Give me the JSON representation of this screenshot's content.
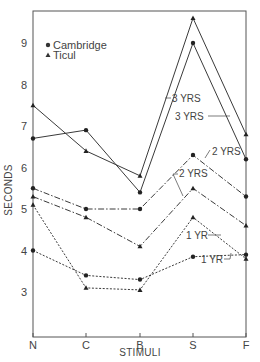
{
  "chart_data": {
    "type": "line",
    "title": "",
    "xlabel": "STIMULI",
    "ylabel": "SECONDS",
    "categories": [
      "N",
      "C",
      "B",
      "S",
      "F"
    ],
    "ylim": [
      2.1,
      9.8
    ],
    "yticks": [
      3,
      4,
      5,
      6,
      7,
      8,
      9
    ],
    "grid": false,
    "legend": {
      "position": "upper-left",
      "entries": [
        {
          "label": "Cambridge",
          "marker": "circle"
        },
        {
          "label": "Ticul",
          "marker": "triangle"
        }
      ]
    },
    "series": [
      {
        "name": "Cambridge 3 YRS",
        "group": "Cambridge",
        "age": "3 YRS",
        "marker": "circle",
        "linestyle": "solid",
        "values": [
          6.7,
          6.9,
          5.4,
          9.0,
          6.2
        ]
      },
      {
        "name": "Ticul 3 YRS",
        "group": "Ticul",
        "age": "3 YRS",
        "marker": "triangle",
        "linestyle": "solid",
        "values": [
          7.5,
          6.4,
          5.8,
          9.6,
          6.8
        ]
      },
      {
        "name": "Cambridge 2 YRS",
        "group": "Cambridge",
        "age": "2 YRS",
        "marker": "circle",
        "linestyle": "dashdot",
        "values": [
          5.5,
          5.0,
          5.0,
          6.3,
          5.3
        ]
      },
      {
        "name": "Ticul 2 YRS",
        "group": "Ticul",
        "age": "2 YRS",
        "marker": "triangle",
        "linestyle": "dashdot",
        "values": [
          5.3,
          4.8,
          4.1,
          5.5,
          4.6
        ]
      },
      {
        "name": "Cambridge 1 YR",
        "group": "Cambridge",
        "age": "1 YR",
        "marker": "circle",
        "linestyle": "dotted",
        "values": [
          4.0,
          3.4,
          3.3,
          3.85,
          3.9
        ]
      },
      {
        "name": "Ticul 1 YR",
        "group": "Ticul",
        "age": "1 YR",
        "marker": "triangle",
        "linestyle": "dotted",
        "values": [
          5.1,
          3.1,
          3.05,
          4.8,
          3.8
        ]
      }
    ],
    "annotations": [
      "3 YRS",
      "3 YRS",
      "2 YRS",
      "2 YRS",
      "1 YR",
      "1 YR"
    ]
  },
  "labels": {
    "xlabel": "STIMULI",
    "ylabel": "SECONDS",
    "legend_cambridge": "Cambridge",
    "legend_ticul": "Ticul",
    "ann_3yrs_a": "3 YRS",
    "ann_3yrs_b": "3 YRS",
    "ann_2yrs_a": "2 YRS",
    "ann_2yrs_b": "2 YRS",
    "ann_1yr_a": "1 YR",
    "ann_1yr_b": "1 YR"
  },
  "colors": {
    "line": "#3a3a3a",
    "axis": "#555555",
    "background": "#ffffff"
  }
}
